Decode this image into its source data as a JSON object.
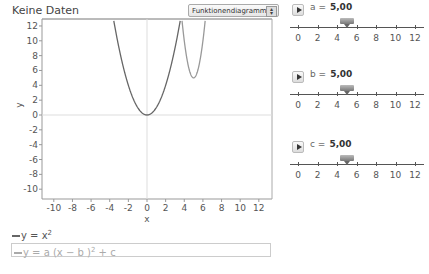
{
  "header": {
    "title": "Keine Daten",
    "chart_type_select": {
      "selected": "Funktionendiagramm",
      "arrows_icon": "up-down-arrows"
    }
  },
  "graph": {
    "xlabel": "x",
    "ylabel": "y",
    "x_ticks": [
      "-10",
      "-8",
      "-6",
      "-4",
      "-2",
      "0",
      "2",
      "4",
      "6",
      "8",
      "10",
      "12"
    ],
    "y_ticks": [
      "12",
      "10",
      "8",
      "6",
      "4",
      "2",
      "0",
      "-2",
      "-4",
      "-6",
      "-8",
      "-10"
    ],
    "curve_colors": {
      "f1": "#666666",
      "f2": "#999999"
    }
  },
  "chart_data": {
    "type": "line",
    "title": "Keine Daten",
    "xlabel": "x",
    "ylabel": "y",
    "xlim": [
      -11,
      13
    ],
    "ylim": [
      -11,
      13
    ],
    "x_ticks": [
      -10,
      -8,
      -6,
      -4,
      -2,
      0,
      2,
      4,
      6,
      8,
      10,
      12
    ],
    "y_ticks": [
      -10,
      -8,
      -6,
      -4,
      -2,
      0,
      2,
      4,
      6,
      8,
      10,
      12
    ],
    "grid": false,
    "series": [
      {
        "name": "y = x^2",
        "formula": "x^2",
        "color": "#666666"
      },
      {
        "name": "y = a (x - b)^2 + c",
        "formula": "a*(x-b)^2+c",
        "params": {
          "a": 5.0,
          "b": 5.0,
          "c": 5.0
        },
        "color": "#999999"
      }
    ]
  },
  "legend": {
    "items": [
      {
        "prefix": "y = x",
        "sup": "2",
        "suffix": ""
      },
      {
        "prefix": "y = a (x − b )",
        "sup": "2",
        "suffix": " + c"
      }
    ]
  },
  "sliders": [
    {
      "name": "a",
      "value": "5,00",
      "ticks": [
        "0",
        "2",
        "4",
        "6",
        "8",
        "10",
        "12"
      ],
      "numeric": 5.0
    },
    {
      "name": "b",
      "value": "5,00",
      "ticks": [
        "0",
        "2",
        "4",
        "6",
        "8",
        "10",
        "12"
      ],
      "numeric": 5.0
    },
    {
      "name": "c",
      "value": "5,00",
      "ticks": [
        "0",
        "2",
        "4",
        "6",
        "8",
        "10",
        "12"
      ],
      "numeric": 5.0
    }
  ]
}
